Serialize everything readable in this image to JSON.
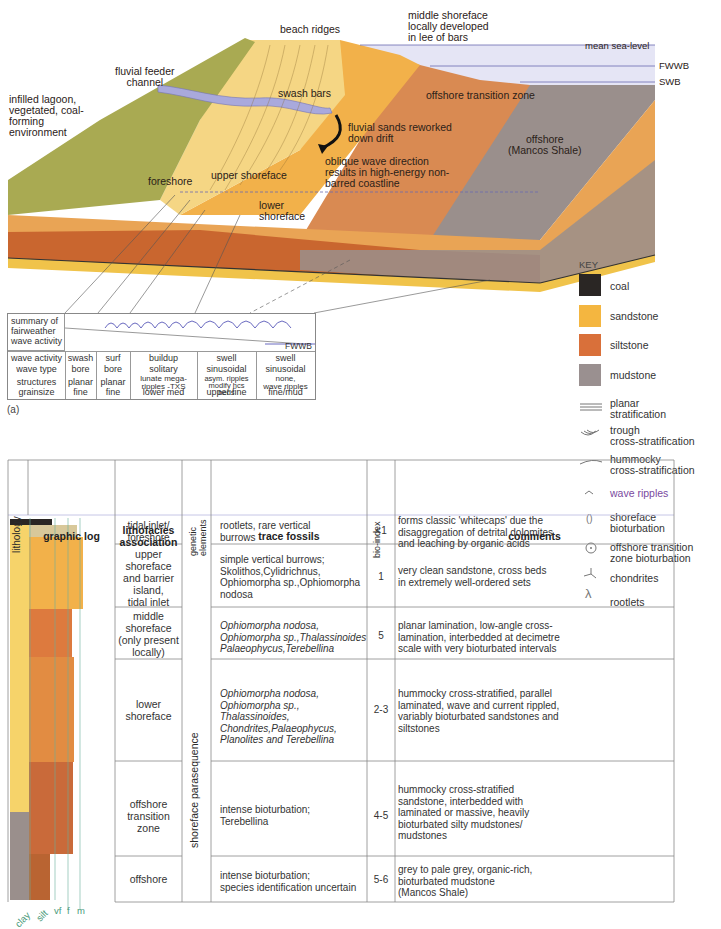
{
  "block_diagram": {
    "labels": {
      "beach_ridges": "beach ridges",
      "middle_shoreface_note": [
        "middle shoreface",
        "locally developed",
        "in lee of bars"
      ],
      "mean_sea_level": "mean sea-level",
      "fwwb": "FWWB",
      "swb": "SWB",
      "fluvial_feeder": [
        "fluvial feeder",
        "channel"
      ],
      "infilled_lagoon": [
        "infilled lagoon,",
        "vegetated, coal-",
        "forming",
        "environment"
      ],
      "swash_bars": "swash bars",
      "offshore_transition_zone": "offshore transition zone",
      "fluvial_sands": [
        "fluvial sands reworked",
        "down drift"
      ],
      "oblique_wave": [
        "oblique wave direction",
        "results in high-energy non-",
        "barred coastline"
      ],
      "offshore": [
        "offshore",
        "(Mancos Shale)"
      ],
      "foreshore": "foreshore",
      "upper_shoreface": "upper shoreface",
      "lower_shoreface": [
        "lower",
        "shoreface"
      ]
    },
    "colors": {
      "vegetation": "#a6a84e",
      "sand_light": "#f3d27a",
      "sand": "#f2b94a",
      "channel": "#a8a8d8",
      "silt": "#d98a4a",
      "silt_dark": "#b8552c",
      "mud": "#948a88",
      "water": "#dcdcf2"
    }
  },
  "summary_table": {
    "header": [
      "summary of",
      "fairweather",
      "wave activity"
    ],
    "fwwb": "FWWB",
    "rows": [
      {
        "label": "wave activity",
        "values": [
          "swash",
          "surf",
          "buildup",
          "swell",
          "swell"
        ]
      },
      {
        "label": "wave type",
        "values": [
          "bore",
          "bore",
          "solitary",
          "sinusoidal",
          "sinusoidal"
        ]
      },
      {
        "label": "structures",
        "values": [
          "planar",
          "planar",
          "lunate mega-\nripples -TXS",
          "asym. ripples\nmodify hcs\nbeds",
          "none,\nwave ripples"
        ]
      },
      {
        "label": "grainsize",
        "values": [
          "fine",
          "fine",
          "lower med",
          "upper fine",
          "fine/mud"
        ]
      }
    ],
    "caption": "(a)"
  },
  "key": {
    "title": "KEY",
    "swatches": [
      {
        "label": "coal",
        "color": "#2a2624"
      },
      {
        "label": "sandstone",
        "color": "#f4b640"
      },
      {
        "label": "siltstone",
        "color": "#d9703a"
      },
      {
        "label": "mudstone",
        "color": "#9a9090"
      }
    ],
    "symbols": [
      {
        "icon": "planar-stratification",
        "label": [
          "planar",
          "stratification"
        ]
      },
      {
        "icon": "trough-cross-stratification",
        "label": [
          "trough",
          "cross-stratification"
        ]
      },
      {
        "icon": "hummocky-cross-stratification",
        "label": [
          "hummocky",
          "cross-stratification"
        ]
      },
      {
        "icon": "wave-ripples",
        "label": [
          "wave ripples"
        ]
      },
      {
        "icon": "shoreface-bioturbation",
        "label": [
          "shoreface",
          "bioturbation"
        ]
      },
      {
        "icon": "offshore-transition-bioturbation",
        "label": [
          "offshore transition",
          "zone bioturbation"
        ]
      },
      {
        "icon": "chondrites",
        "label": [
          "chondrites"
        ]
      },
      {
        "icon": "rootlets",
        "label": [
          "rootlets"
        ]
      }
    ]
  },
  "facies_table": {
    "headers": {
      "lithology": "lithology",
      "graphic_log": "graphic log",
      "lithofacies": [
        "lithofacies",
        "association"
      ],
      "genetic": [
        "genetic",
        "elements"
      ],
      "trace_fossils": "trace fossils",
      "bio_index": "bio-index",
      "comments": "comments"
    },
    "genetic_element": "shoreface parasequence",
    "rows": [
      {
        "facies": [
          "tidal inlet/",
          "foreshore"
        ],
        "trace": "rootlets, rare vertical\nburrows",
        "bio": "<1",
        "comments": "forms classic 'whitecaps' due the\ndisaggregation of detrital dolomites\nand leaching by organic acids"
      },
      {
        "facies": [
          "upper",
          "shoreface",
          "and barrier",
          "island,",
          "tidal inlet"
        ],
        "trace": "simple vertical burrows;\nSkolithos,Cylidrichnus,\nOphiomorpha sp.,Ophiomorpha\nnodosa",
        "bio": "1",
        "comments": "very clean sandstone, cross beds\nin extremely well-ordered sets"
      },
      {
        "facies": [
          "middle",
          "shoreface",
          "(only present",
          "locally)"
        ],
        "trace": "Ophiomorpha nodosa,\nOphiomorpha sp.,Thalassinoides\nPalaeophycus,Terebellina",
        "bio": "5",
        "comments": "planar lamination, low-angle cross-\nlamination, interbedded at decimetre\nscale with very bioturbated intervals"
      },
      {
        "facies": [
          "lower",
          "shoreface"
        ],
        "trace": "Ophiomorpha nodosa,\nOphiomorpha sp.,\nThalassinoides,\nChondrites,Palaeophycus,\nPlanolites and Terebellina",
        "bio": "2-3",
        "comments": "hummocky cross-stratified, parallel\nlaminated, wave and current rippled,\nvariably bioturbated sandstones and\nsiltstones"
      },
      {
        "facies": [
          "offshore",
          "transition",
          "zone"
        ],
        "trace": "intense bioturbation;\nTerebellina",
        "bio": "4-5",
        "comments": "hummocky cross-stratified\nsandstone, interbedded with\nlaminated or massive, heavily\nbioturbated silty mudstones/\nmudstones"
      },
      {
        "facies": [
          "offshore"
        ],
        "trace": "intense bioturbation;\nspecies identification uncertain",
        "bio": "5-6",
        "comments": "grey to pale grey, organic-rich,\nbioturbated mudstone\n(Mancos Shale)"
      }
    ],
    "grain_axis": [
      "clay",
      "silt",
      "vf",
      "f",
      "m"
    ]
  }
}
